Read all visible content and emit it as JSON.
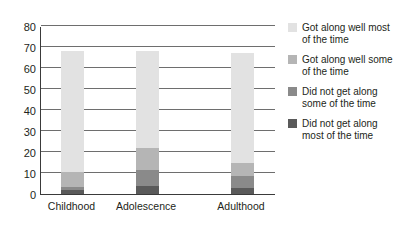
{
  "chart_data": {
    "type": "bar",
    "subtype": "stacked-bar",
    "title": "",
    "xlabel": "",
    "ylabel": "",
    "ylim": [
      0,
      80
    ],
    "yticks": [
      0,
      10,
      20,
      30,
      40,
      50,
      60,
      70,
      80
    ],
    "grid": true,
    "legend_position": "right",
    "categories": [
      "Childhood",
      "Adolescence",
      "Adulthood"
    ],
    "series": [
      {
        "name": "Did not get along most of the time",
        "color": "#5a5a5a",
        "values": [
          2,
          4,
          3
        ]
      },
      {
        "name": "Did not get along some of the time",
        "color": "#8a8a8a",
        "values": [
          1.5,
          7.5,
          5.5
        ]
      },
      {
        "name": "Got along well some of the time",
        "color": "#b5b5b5",
        "values": [
          7,
          10.5,
          6.5
        ]
      },
      {
        "name": "Got along well most of the time",
        "color": "#e2e2e2",
        "values": [
          57.5,
          46,
          52
        ]
      }
    ],
    "totals": [
      68,
      68,
      67
    ]
  },
  "legend": {
    "items": [
      {
        "label": "Got along well most of the time",
        "color": "#e2e2e2"
      },
      {
        "label": "Got along well some of the time",
        "color": "#b5b5b5"
      },
      {
        "label": "Did not get along some of the time",
        "color": "#8a8a8a"
      },
      {
        "label": "Did not get along most of the time",
        "color": "#5a5a5a"
      }
    ]
  },
  "axis": {
    "y_labels": [
      "80",
      "70",
      "60",
      "50",
      "40",
      "30",
      "20",
      "10",
      "0"
    ],
    "x_labels": [
      "Childhood",
      "Adolescence",
      "Adulthood"
    ]
  }
}
